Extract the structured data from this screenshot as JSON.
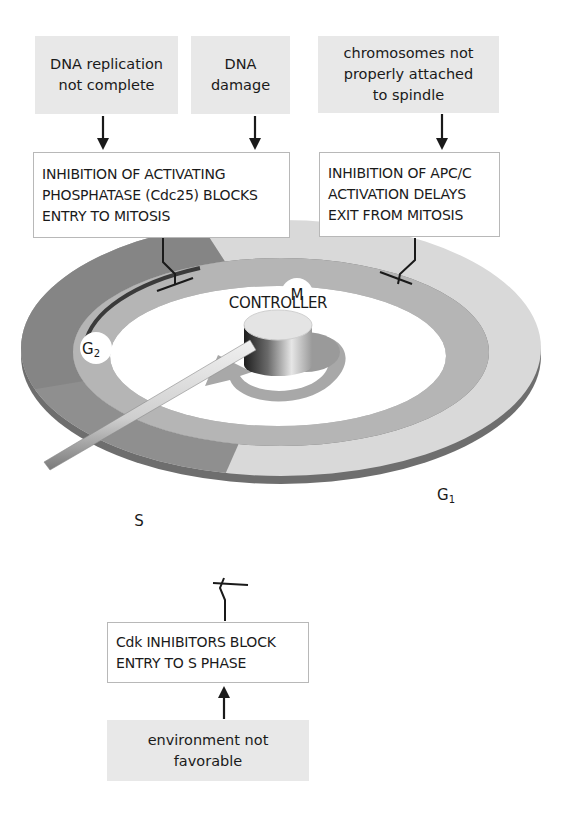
{
  "checkpoints": {
    "g2m": {
      "inputs": [
        {
          "lines": [
            "DNA replication",
            "not complete"
          ]
        },
        {
          "lines": [
            "DNA",
            "damage"
          ]
        }
      ],
      "effect": {
        "lines": [
          "INHIBITION OF ACTIVATING",
          "PHOSPHATASE (Cdc25) BLOCKS",
          "ENTRY TO MITOSIS"
        ]
      }
    },
    "metaphase": {
      "inputs": [
        {
          "lines": [
            "chromosomes not",
            "properly attached",
            "to spindle"
          ]
        }
      ],
      "effect": {
        "lines": [
          "INHIBITION OF APC/C",
          "ACTIVATION DELAYS",
          "EXIT FROM MITOSIS"
        ]
      }
    },
    "g1s": {
      "input": {
        "lines": [
          "environment not",
          "favorable"
        ]
      },
      "effect": {
        "lines": [
          "Cdk INHIBITORS BLOCK",
          "ENTRY TO S PHASE"
        ]
      }
    }
  },
  "controller": {
    "label": "CONTROLLER",
    "phases": [
      {
        "id": "M",
        "base": "M",
        "sub": ""
      },
      {
        "id": "G1",
        "base": "G",
        "sub": "1"
      },
      {
        "id": "S",
        "base": "S",
        "sub": ""
      },
      {
        "id": "G2",
        "base": "G",
        "sub": "2"
      }
    ]
  },
  "colors": {
    "box_gray": "#e8e8e8",
    "box_border": "#b8b8b8",
    "phase_m_g1": "#d9d9d9",
    "phase_s_g2": "#8f8f8f",
    "inner_track": "#b5b5b5",
    "ink": "#1a1a1a"
  }
}
